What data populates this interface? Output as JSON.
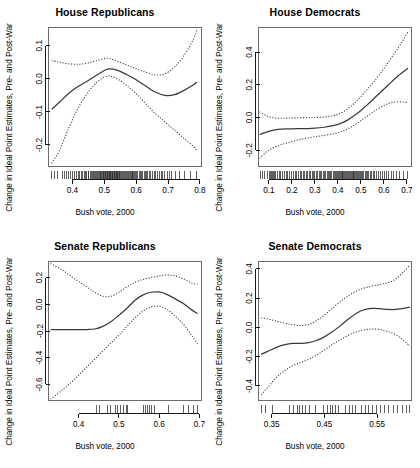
{
  "figure": {
    "width": 420,
    "height": 468,
    "background": "#ffffff",
    "line_color": "#3a3a3a",
    "layout": "2x2 grid of small-multiple lowess panels"
  },
  "chart_data": [
    {
      "type": "line",
      "panel": "top-left",
      "title": "House Republicans",
      "xlabel": "Bush vote, 2000",
      "ylabel": "Change in Ideal Point Estimates, Pre- and Post-War",
      "xlim": [
        0.325,
        0.805
      ],
      "ylim": [
        -0.265,
        0.155
      ],
      "xticks": [
        0.4,
        0.5,
        0.6,
        0.7,
        0.8
      ],
      "xtick_labels": [
        "0.4",
        "0.5",
        "0.6",
        "0.7",
        "0.8"
      ],
      "yticks": [
        0.1,
        0.0,
        -0.1,
        -0.2
      ],
      "ytick_labels": [
        "0.1",
        "0.0",
        "-0.1",
        "-0.2"
      ],
      "grid": false,
      "legend": "none",
      "series": [
        {
          "name": "lowess fit",
          "style": "solid",
          "x": [
            0.335,
            0.36,
            0.39,
            0.42,
            0.45,
            0.48,
            0.51,
            0.54,
            0.57,
            0.6,
            0.63,
            0.66,
            0.69,
            0.72,
            0.75,
            0.78,
            0.79
          ],
          "y": [
            -0.092,
            -0.07,
            -0.043,
            -0.022,
            -0.005,
            0.013,
            0.029,
            0.026,
            0.013,
            -0.003,
            -0.022,
            -0.04,
            -0.05,
            -0.048,
            -0.035,
            -0.018,
            -0.01
          ]
        },
        {
          "name": "upper confidence band",
          "style": "dotted",
          "x": [
            0.335,
            0.36,
            0.39,
            0.42,
            0.45,
            0.48,
            0.51,
            0.54,
            0.57,
            0.6,
            0.63,
            0.66,
            0.69,
            0.72,
            0.75,
            0.78,
            0.79
          ],
          "y": [
            0.055,
            0.05,
            0.045,
            0.044,
            0.048,
            0.056,
            0.062,
            0.053,
            0.042,
            0.03,
            0.02,
            0.012,
            0.015,
            0.035,
            0.07,
            0.12,
            0.148
          ]
        },
        {
          "name": "lower confidence band",
          "style": "dotted",
          "x": [
            0.335,
            0.36,
            0.39,
            0.42,
            0.45,
            0.48,
            0.51,
            0.54,
            0.57,
            0.6,
            0.63,
            0.66,
            0.69,
            0.72,
            0.75,
            0.78,
            0.79
          ],
          "y": [
            -0.255,
            -0.215,
            -0.145,
            -0.085,
            -0.04,
            -0.008,
            0.008,
            0.0,
            -0.02,
            -0.045,
            -0.075,
            -0.105,
            -0.13,
            -0.155,
            -0.18,
            -0.205,
            -0.218
          ]
        }
      ],
      "rug": {
        "label": "rug of observed Bush vote shares",
        "x": [
          0.335,
          0.345,
          0.352,
          0.368,
          0.374,
          0.381,
          0.389,
          0.395,
          0.401,
          0.406,
          0.412,
          0.418,
          0.422,
          0.428,
          0.433,
          0.437,
          0.441,
          0.445,
          0.449,
          0.452,
          0.456,
          0.459,
          0.463,
          0.466,
          0.469,
          0.472,
          0.475,
          0.478,
          0.481,
          0.484,
          0.487,
          0.489,
          0.492,
          0.494,
          0.497,
          0.499,
          0.501,
          0.503,
          0.505,
          0.507,
          0.509,
          0.511,
          0.513,
          0.515,
          0.517,
          0.519,
          0.521,
          0.523,
          0.525,
          0.527,
          0.529,
          0.531,
          0.533,
          0.535,
          0.537,
          0.539,
          0.541,
          0.543,
          0.545,
          0.547,
          0.549,
          0.551,
          0.554,
          0.557,
          0.56,
          0.563,
          0.566,
          0.569,
          0.572,
          0.575,
          0.578,
          0.581,
          0.584,
          0.587,
          0.59,
          0.593,
          0.596,
          0.599,
          0.602,
          0.605,
          0.609,
          0.613,
          0.617,
          0.621,
          0.625,
          0.629,
          0.633,
          0.637,
          0.641,
          0.646,
          0.651,
          0.656,
          0.661,
          0.666,
          0.672,
          0.678,
          0.684,
          0.69,
          0.697,
          0.704,
          0.712,
          0.722,
          0.735,
          0.752,
          0.771,
          0.788
        ]
      }
    },
    {
      "type": "line",
      "panel": "top-right",
      "title": "House Democrats",
      "xlabel": "Bush vote, 2000",
      "ylabel": "Change in Ideal Point Estimates, Pre- and Post-War",
      "xlim": [
        0.055,
        0.72
      ],
      "ylim": [
        -0.3,
        0.55
      ],
      "xticks": [
        0.1,
        0.2,
        0.3,
        0.4,
        0.5,
        0.6,
        0.7
      ],
      "xtick_labels": [
        "0.1",
        "0.2",
        "0.3",
        "0.4",
        "0.5",
        "0.6",
        "0.7"
      ],
      "yticks": [
        0.4,
        0.2,
        0.0,
        -0.2
      ],
      "ytick_labels": [
        "0.4",
        "0.2",
        "0.0",
        "-0.2"
      ],
      "grid": false,
      "legend": "none",
      "series": [
        {
          "name": "lowess fit",
          "style": "solid",
          "x": [
            0.06,
            0.09,
            0.12,
            0.15,
            0.18,
            0.22,
            0.26,
            0.3,
            0.34,
            0.38,
            0.41,
            0.44,
            0.47,
            0.5,
            0.53,
            0.56,
            0.59,
            0.62,
            0.65,
            0.68,
            0.705
          ],
          "y": [
            -0.105,
            -0.09,
            -0.078,
            -0.072,
            -0.07,
            -0.069,
            -0.068,
            -0.066,
            -0.06,
            -0.05,
            -0.038,
            -0.018,
            0.01,
            0.043,
            0.08,
            0.12,
            0.16,
            0.2,
            0.24,
            0.275,
            0.3
          ]
        },
        {
          "name": "upper confidence band",
          "style": "dotted",
          "x": [
            0.06,
            0.09,
            0.12,
            0.15,
            0.18,
            0.22,
            0.26,
            0.3,
            0.34,
            0.38,
            0.41,
            0.44,
            0.47,
            0.5,
            0.53,
            0.56,
            0.59,
            0.62,
            0.65,
            0.68,
            0.705
          ],
          "y": [
            0.035,
            0.01,
            -0.002,
            -0.005,
            -0.004,
            -0.002,
            -0.001,
            0.0,
            0.003,
            0.012,
            0.025,
            0.05,
            0.085,
            0.128,
            0.175,
            0.225,
            0.28,
            0.34,
            0.4,
            0.465,
            0.525
          ]
        },
        {
          "name": "lower confidence band",
          "style": "dotted",
          "x": [
            0.06,
            0.09,
            0.12,
            0.15,
            0.18,
            0.22,
            0.26,
            0.3,
            0.34,
            0.38,
            0.41,
            0.44,
            0.47,
            0.5,
            0.53,
            0.56,
            0.59,
            0.62,
            0.65,
            0.68,
            0.705
          ],
          "y": [
            -0.25,
            -0.21,
            -0.185,
            -0.168,
            -0.155,
            -0.14,
            -0.128,
            -0.118,
            -0.11,
            -0.1,
            -0.09,
            -0.072,
            -0.048,
            -0.02,
            0.01,
            0.04,
            0.065,
            0.085,
            0.095,
            0.095,
            0.09
          ]
        }
      ],
      "rug": {
        "label": "rug of observed Bush vote shares",
        "x": [
          0.062,
          0.071,
          0.082,
          0.093,
          0.101,
          0.108,
          0.113,
          0.118,
          0.122,
          0.126,
          0.131,
          0.137,
          0.145,
          0.152,
          0.161,
          0.168,
          0.175,
          0.182,
          0.191,
          0.198,
          0.206,
          0.214,
          0.221,
          0.229,
          0.236,
          0.242,
          0.249,
          0.255,
          0.262,
          0.268,
          0.275,
          0.281,
          0.288,
          0.294,
          0.3,
          0.306,
          0.312,
          0.318,
          0.324,
          0.33,
          0.336,
          0.342,
          0.348,
          0.353,
          0.359,
          0.364,
          0.369,
          0.374,
          0.379,
          0.384,
          0.389,
          0.394,
          0.398,
          0.402,
          0.406,
          0.41,
          0.414,
          0.418,
          0.422,
          0.426,
          0.43,
          0.434,
          0.438,
          0.442,
          0.446,
          0.45,
          0.454,
          0.458,
          0.462,
          0.466,
          0.47,
          0.474,
          0.478,
          0.482,
          0.486,
          0.49,
          0.494,
          0.498,
          0.503,
          0.508,
          0.513,
          0.518,
          0.523,
          0.529,
          0.535,
          0.541,
          0.547,
          0.554,
          0.561,
          0.568,
          0.576,
          0.584,
          0.592,
          0.601,
          0.61,
          0.62,
          0.631,
          0.643,
          0.656,
          0.67,
          0.686,
          0.703
        ]
      }
    },
    {
      "type": "line",
      "panel": "bottom-left",
      "title": "Senate Republicans",
      "xlabel": "Bush vote, 2000",
      "ylabel": "Change in Ideal Point Estimates, Pre- and Post-War",
      "xlim": [
        0.325,
        0.705
      ],
      "ylim": [
        -0.72,
        0.32
      ],
      "xticks": [
        0.4,
        0.5,
        0.6,
        0.7
      ],
      "xtick_labels": [
        "0.4",
        "0.5",
        "0.6",
        "0.7"
      ],
      "yticks": [
        0.2,
        0.0,
        -0.2,
        -0.4,
        -0.6
      ],
      "ytick_labels": [
        "0.2",
        "0.0",
        "-0.2",
        "-0.4",
        "-0.6"
      ],
      "grid": false,
      "legend": "none",
      "series": [
        {
          "name": "lowess fit",
          "style": "solid",
          "x": [
            0.33,
            0.36,
            0.39,
            0.42,
            0.44,
            0.46,
            0.48,
            0.5,
            0.52,
            0.54,
            0.56,
            0.58,
            0.6,
            0.62,
            0.64,
            0.66,
            0.68,
            0.695
          ],
          "y": [
            -0.19,
            -0.19,
            -0.19,
            -0.189,
            -0.185,
            -0.165,
            -0.13,
            -0.082,
            -0.03,
            0.03,
            0.07,
            0.09,
            0.092,
            0.072,
            0.04,
            0.005,
            -0.04,
            -0.07
          ]
        },
        {
          "name": "upper confidence band",
          "style": "dotted",
          "x": [
            0.33,
            0.36,
            0.39,
            0.42,
            0.44,
            0.46,
            0.48,
            0.5,
            0.52,
            0.54,
            0.56,
            0.58,
            0.6,
            0.62,
            0.64,
            0.66,
            0.68,
            0.695
          ],
          "y": [
            0.305,
            0.255,
            0.19,
            0.13,
            0.09,
            0.06,
            0.06,
            0.09,
            0.13,
            0.165,
            0.185,
            0.2,
            0.212,
            0.22,
            0.212,
            0.19,
            0.16,
            0.148
          ]
        },
        {
          "name": "lower confidence band",
          "style": "dotted",
          "x": [
            0.33,
            0.36,
            0.39,
            0.42,
            0.44,
            0.46,
            0.48,
            0.5,
            0.52,
            0.54,
            0.56,
            0.58,
            0.6,
            0.62,
            0.64,
            0.66,
            0.68,
            0.695
          ],
          "y": [
            -0.71,
            -0.64,
            -0.56,
            -0.47,
            -0.41,
            -0.35,
            -0.29,
            -0.23,
            -0.165,
            -0.1,
            -0.05,
            -0.02,
            -0.015,
            -0.04,
            -0.09,
            -0.15,
            -0.23,
            -0.295
          ]
        }
      ],
      "rug": {
        "label": "rug of observed Bush vote shares",
        "x": [
          0.445,
          0.452,
          0.471,
          0.478,
          0.492,
          0.497,
          0.503,
          0.511,
          0.518,
          0.522,
          0.56,
          0.566,
          0.571,
          0.576,
          0.582,
          0.588,
          0.622,
          0.66,
          0.672,
          0.686,
          0.694
        ]
      }
    },
    {
      "type": "line",
      "panel": "bottom-right",
      "title": "Senate Democrats",
      "xlabel": "Bush vote, 2000",
      "ylabel": "Change in Ideal Point Estimates, Pre- and Post-War",
      "xlim": [
        0.325,
        0.615
      ],
      "ylim": [
        -0.5,
        0.45
      ],
      "xticks": [
        0.35,
        0.45,
        0.55
      ],
      "xtick_labels": [
        "0.35",
        "0.45",
        "0.55"
      ],
      "yticks": [
        0.4,
        0.2,
        0.0,
        -0.2,
        -0.4
      ],
      "ytick_labels": [
        "0.4",
        "0.2",
        "0.0",
        "-0.2",
        "-0.4"
      ],
      "grid": false,
      "legend": "none",
      "series": [
        {
          "name": "lowess fit",
          "style": "solid",
          "x": [
            0.33,
            0.345,
            0.36,
            0.375,
            0.39,
            0.405,
            0.42,
            0.435,
            0.45,
            0.465,
            0.48,
            0.495,
            0.51,
            0.525,
            0.54,
            0.555,
            0.57,
            0.585,
            0.6,
            0.612
          ],
          "y": [
            -0.185,
            -0.16,
            -0.135,
            -0.118,
            -0.11,
            -0.11,
            -0.105,
            -0.09,
            -0.065,
            -0.03,
            0.01,
            0.055,
            0.095,
            0.12,
            0.13,
            0.128,
            0.122,
            0.122,
            0.13,
            0.138
          ]
        },
        {
          "name": "upper confidence band",
          "style": "dotted",
          "x": [
            0.33,
            0.345,
            0.36,
            0.375,
            0.39,
            0.405,
            0.42,
            0.435,
            0.45,
            0.465,
            0.48,
            0.495,
            0.51,
            0.525,
            0.54,
            0.555,
            0.57,
            0.585,
            0.6,
            0.612
          ],
          "y": [
            0.065,
            0.055,
            0.042,
            0.028,
            0.018,
            0.012,
            0.02,
            0.045,
            0.085,
            0.13,
            0.175,
            0.215,
            0.248,
            0.268,
            0.282,
            0.292,
            0.305,
            0.33,
            0.38,
            0.425
          ]
        },
        {
          "name": "lower confidence band",
          "style": "dotted",
          "x": [
            0.33,
            0.345,
            0.36,
            0.375,
            0.39,
            0.405,
            0.42,
            0.435,
            0.45,
            0.465,
            0.48,
            0.495,
            0.51,
            0.525,
            0.54,
            0.555,
            0.57,
            0.585,
            0.6,
            0.612
          ],
          "y": [
            -0.46,
            -0.4,
            -0.34,
            -0.295,
            -0.262,
            -0.24,
            -0.218,
            -0.19,
            -0.155,
            -0.118,
            -0.085,
            -0.055,
            -0.032,
            -0.018,
            -0.012,
            -0.015,
            -0.028,
            -0.05,
            -0.09,
            -0.128
          ]
        }
      ],
      "rug": {
        "label": "rug of observed Bush vote shares",
        "x": [
          0.331,
          0.338,
          0.352,
          0.383,
          0.391,
          0.398,
          0.403,
          0.409,
          0.414,
          0.421,
          0.433,
          0.448,
          0.455,
          0.461,
          0.466,
          0.471,
          0.477,
          0.489,
          0.497,
          0.503,
          0.509,
          0.521,
          0.528,
          0.534,
          0.541,
          0.548,
          0.556,
          0.563,
          0.571,
          0.581,
          0.589,
          0.597,
          0.605,
          0.611
        ]
      }
    }
  ]
}
